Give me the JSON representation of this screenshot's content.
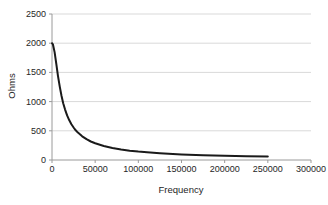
{
  "chart_data": {
    "type": "line",
    "title": "",
    "xlabel": "Frequency",
    "ylabel": "Ohms",
    "xlim": [
      0,
      300000
    ],
    "ylim": [
      0,
      2500
    ],
    "x_ticks": [
      0,
      50000,
      100000,
      150000,
      200000,
      250000,
      300000
    ],
    "y_ticks": [
      0,
      500,
      1000,
      1500,
      2000,
      2500
    ],
    "grid": "horizontal-major-only",
    "legend_position": "none",
    "series": [
      {
        "name": "impedance-curve",
        "color": "#1a1a1a",
        "points": [
          [
            0,
            2000
          ],
          [
            1000,
            1981
          ],
          [
            3000,
            1847
          ],
          [
            5000,
            1645
          ],
          [
            7000,
            1437
          ],
          [
            9000,
            1253
          ],
          [
            11000,
            1099
          ],
          [
            13000,
            973
          ],
          [
            15000,
            869
          ],
          [
            17500,
            764
          ],
          [
            20000,
            680
          ],
          [
            22500,
            612
          ],
          [
            25000,
            556
          ],
          [
            27500,
            509
          ],
          [
            30000,
            469
          ],
          [
            35000,
            405
          ],
          [
            40000,
            356
          ],
          [
            45000,
            317
          ],
          [
            50000,
            286
          ],
          [
            60000,
            239
          ],
          [
            70000,
            206
          ],
          [
            80000,
            180
          ],
          [
            90000,
            160
          ],
          [
            100000,
            144
          ],
          [
            110000,
            131
          ],
          [
            125000,
            116
          ],
          [
            150000,
            96
          ],
          [
            175000,
            83
          ],
          [
            200000,
            72
          ],
          [
            225000,
            64
          ],
          [
            250000,
            58
          ]
        ]
      }
    ]
  },
  "colors": {
    "background": "#ffffff",
    "gridline": "#d9d9d9",
    "axis": "#9a9a9a",
    "tick": "#9a9a9a",
    "text": "#262626",
    "curve": "#1a1a1a"
  }
}
